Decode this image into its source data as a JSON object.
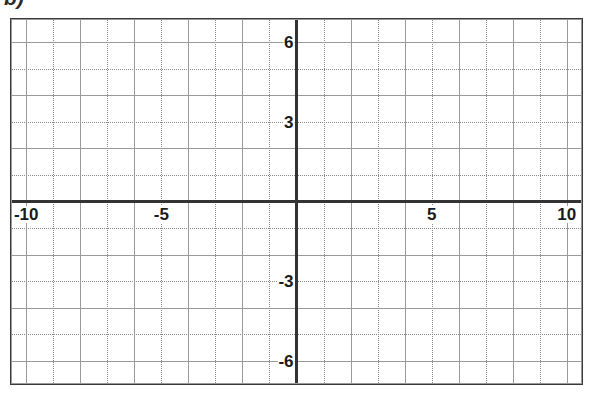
{
  "problem": {
    "label": "b)"
  },
  "chart_data": {
    "type": "line",
    "title": "",
    "subtitle": "",
    "xlabel": "",
    "ylabel": "",
    "series": [],
    "values": [],
    "categories": [],
    "grid": true,
    "legend": false,
    "legend_position": "none",
    "xlim": [
      -10.6,
      10.6
    ],
    "ylim": [
      -6.9,
      6.9
    ],
    "x_tick_labels": [
      "-10",
      "-5",
      "5",
      "10"
    ],
    "x_tick_values": [
      -10,
      -5,
      5,
      10
    ],
    "y_tick_labels": [
      "6",
      "3",
      "-3",
      "-6"
    ],
    "y_tick_values": [
      6,
      3,
      -3,
      -6
    ],
    "x_major_step": 2,
    "x_minor_step": 1,
    "y_major_step": 2,
    "y_minor_step": 1,
    "origin": [
      0,
      0
    ],
    "colors": {
      "axis": "#333333",
      "major_grid": "#9a9a9a",
      "minor_grid": "#8a8a8a",
      "border": "#3a3a3a",
      "label_text": "#1a1a1a",
      "background": "#ffffff"
    }
  }
}
